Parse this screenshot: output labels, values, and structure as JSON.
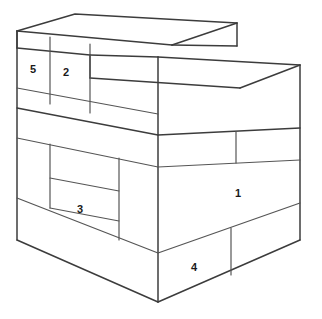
{
  "figure": {
    "type": "line-drawing",
    "background_color": "#ffffff",
    "stroke_color": "#3c3c3c",
    "label_color": "#1a1a1a",
    "width": 322,
    "height": 319,
    "labels": [
      {
        "id": "label-1",
        "text": "1",
        "x": 238,
        "y": 194,
        "face": "front-right-lower-large"
      },
      {
        "id": "label-2",
        "text": "2",
        "x": 66,
        "y": 73,
        "face": "left-upper-riser-second"
      },
      {
        "id": "label-3",
        "text": "3",
        "x": 80,
        "y": 210,
        "face": "left-middle-inner"
      },
      {
        "id": "label-4",
        "text": "4",
        "x": 194,
        "y": 268,
        "face": "front-right-bottom"
      },
      {
        "id": "label-5",
        "text": "5",
        "x": 33,
        "y": 70,
        "face": "left-upper-riser-first"
      }
    ]
  }
}
